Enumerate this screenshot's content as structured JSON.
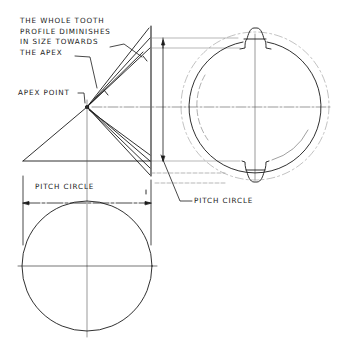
{
  "diagram": {
    "annotations": {
      "tooth_profile_note": [
        "THE WHOLE TOOTH",
        "PROFILE DIMINISHES",
        "IN SIZE TOWARDS",
        "THE APEX"
      ],
      "apex_point": "APEX POINT",
      "pitch_circle_dimension": "PITCH CIRCLE",
      "pitch_circle_leader": "PITCH CIRCLE"
    },
    "views": [
      {
        "name": "cone-elevation",
        "description": "Triangular pitch cone with tooth lines converging at apex"
      },
      {
        "name": "end-view",
        "description": "Circle with two tooth profiles at top and bottom, dashed pitch and root circles"
      },
      {
        "name": "plan-view",
        "description": "Pitch circle with centre lines"
      }
    ],
    "colors": {
      "ink": "#1a1a1a",
      "construction": "#8a8a8a",
      "background": "#ffffff"
    }
  }
}
